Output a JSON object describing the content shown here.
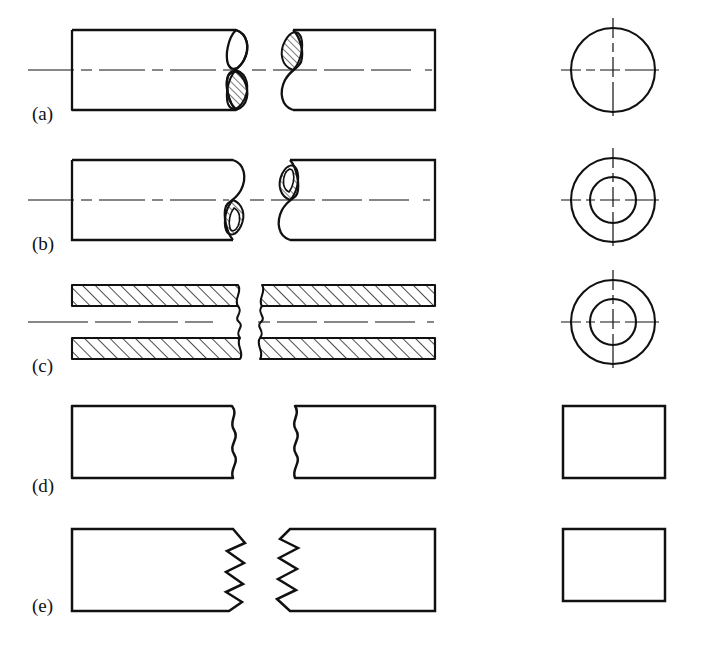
{
  "figure": {
    "background_color": "#ffffff",
    "line_color": "#111111",
    "width": 705,
    "height": 650,
    "columns": [
      {
        "name": "left-piece",
        "description": "left broken part of the member"
      },
      {
        "name": "right-piece",
        "description": "right broken part of the member"
      },
      {
        "name": "section-view",
        "description": "cross-section end view of the member"
      }
    ],
    "rows": [
      {
        "label": "(a)",
        "label_x": 32,
        "label_y": 120,
        "member": "solid round rod",
        "break_type": "S-break with hatched elliptical face",
        "section": "single circle with centre lines",
        "has_centerline": true,
        "hatched": true
      },
      {
        "label": "(b)",
        "label_x": 32,
        "label_y": 250,
        "member": "hollow round tube",
        "break_type": "S-break with hatched annular elliptical face",
        "section": "two concentric circles with centre lines",
        "has_centerline": true,
        "hatched": true
      },
      {
        "label": "(c)",
        "label_x": 32,
        "label_y": 372,
        "member": "sectioned hollow tube",
        "break_type": "freehand wavy break line",
        "section": "two concentric circles with centre lines",
        "has_centerline": true,
        "hatched": true
      },
      {
        "label": "(d)",
        "label_x": 32,
        "label_y": 492,
        "member": "rectangular metal bar",
        "break_type": "freehand wavy break line",
        "section": "plain square outline",
        "has_centerline": false,
        "hatched": false
      },
      {
        "label": "(e)",
        "label_x": 32,
        "label_y": 612,
        "member": "rectangular wood member",
        "break_type": "zigzag (serrated) break line",
        "section": "plain square outline",
        "has_centerline": false,
        "hatched": false
      }
    ]
  }
}
